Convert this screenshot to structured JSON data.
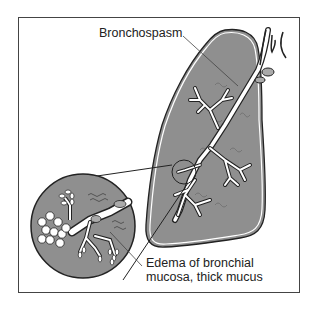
{
  "figure": {
    "labels": {
      "bronchospasm": "Bronchospasm",
      "edema_line1": "Edema of bronchial",
      "edema_line2": "mucosa, thick mucus"
    },
    "colors": {
      "lung_fill": "#8f8f8f",
      "outline": "#222222",
      "bronchi": "#ffffff",
      "frame": "#444444",
      "background": "#ffffff"
    }
  }
}
